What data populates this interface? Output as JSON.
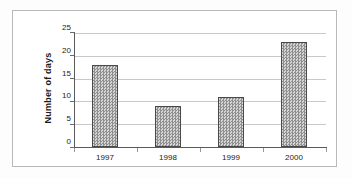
{
  "chart_data": {
    "type": "bar",
    "title": "",
    "subtitle": "",
    "xlabel": "",
    "ylabel": "Number of days",
    "categories": [
      "1997",
      "1998",
      "1999",
      "2000"
    ],
    "values": [
      18,
      9,
      11,
      23
    ],
    "series": [
      {
        "name": "Number of days",
        "values": [
          18,
          9,
          11,
          23
        ]
      }
    ],
    "ylim": [
      0,
      25
    ],
    "ytick_labels": [
      "0",
      "5",
      "10",
      "15",
      "20",
      "25"
    ],
    "ytick_values": [
      0,
      5,
      10,
      15,
      20,
      25
    ],
    "grid": true,
    "grid_axis": "y",
    "legend": false,
    "legend_position": "none",
    "annotations": [],
    "colors": {
      "bar_fill": "#a9a9a9",
      "bar_pattern": "#8f8f8f",
      "bar_edge": "#4a4a4a",
      "gridline": "#c8c8c8",
      "axis": "#5a5a5a",
      "text": "#1a1a1a",
      "plot_background": "#ffffff",
      "frame_border": "#b9b9b9"
    }
  }
}
